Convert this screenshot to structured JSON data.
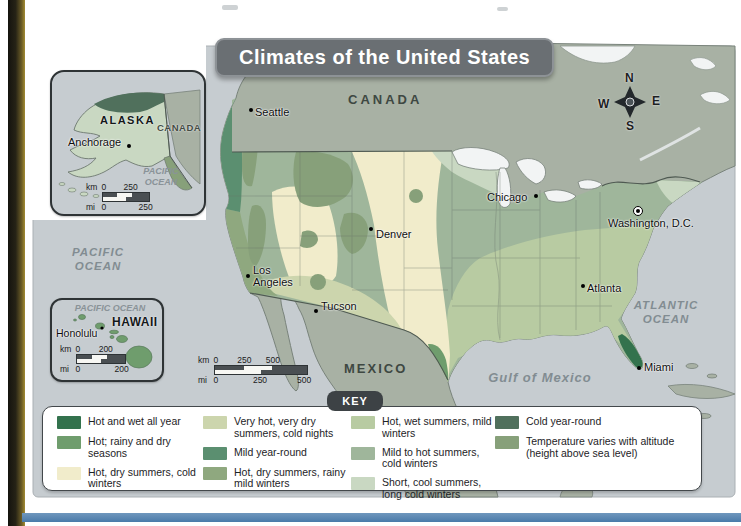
{
  "title": "Climates of the United States",
  "colors": {
    "ocean": "#c6ccd0",
    "foreign_land": "#a8b1a4",
    "lake": "#f2f4f4",
    "title_bg": "#6a6f73",
    "key_tab_bg": "#3d4245"
  },
  "map": {
    "countries": [
      {
        "name": "CANADA"
      },
      {
        "name": "MEXICO"
      }
    ],
    "oceans": [
      {
        "name": "PACIFIC OCEAN"
      },
      {
        "name": "ATLANTIC OCEAN"
      },
      {
        "name": "Gulf of Mexico"
      }
    ],
    "cities": [
      {
        "name": "Seattle"
      },
      {
        "name": "Chicago"
      },
      {
        "name": "Washington, D.C."
      },
      {
        "name": "Denver"
      },
      {
        "name": "Los Angeles"
      },
      {
        "name": "Tucson"
      },
      {
        "name": "Atlanta"
      },
      {
        "name": "Miami"
      }
    ],
    "compass": {
      "north": "N",
      "east": "E",
      "south": "S",
      "west": "W"
    },
    "scale": {
      "unit_top": "km",
      "unit_bottom": "mi",
      "top_ticks": [
        "0",
        "250",
        "500"
      ],
      "bottom_ticks": [
        "0",
        "250",
        "500"
      ]
    }
  },
  "insets": {
    "alaska": {
      "region": "ALASKA",
      "neighbor": "CANADA",
      "city": "Anchorage",
      "ocean": "PACIFIC OCEAN",
      "scale": {
        "unit_top": "km",
        "unit_bottom": "mi",
        "top_ticks": [
          "0",
          "250"
        ],
        "bottom_ticks": [
          "0",
          "250"
        ]
      }
    },
    "hawaii": {
      "region": "HAWAII",
      "city": "Honolulu",
      "ocean": "PACIFIC OCEAN",
      "scale": {
        "unit_top": "km",
        "unit_bottom": "mi",
        "top_ticks": [
          "0",
          "200"
        ],
        "bottom_ticks": [
          "0",
          "200"
        ]
      }
    }
  },
  "key": {
    "title": "KEY",
    "items": [
      {
        "label": "Hot and wet all year",
        "color": "#33724d"
      },
      {
        "label": "Hot; rainy and dry seasons",
        "color": "#6f9d6d"
      },
      {
        "label": "Hot, dry summers, cold winters",
        "color": "#f1eccb"
      },
      {
        "label": "Very hot, very dry summers, cold nights",
        "color": "#ccd5ad"
      },
      {
        "label": "Mild year-round",
        "color": "#5b8f70"
      },
      {
        "label": "Hot, dry summers, rainy mild winters",
        "color": "#8fa87f"
      },
      {
        "label": "Hot, wet summers, mild winters",
        "color": "#b8cba2"
      },
      {
        "label": "Mild to hot summers, cold winters",
        "color": "#9fb69b"
      },
      {
        "label": "Short, cool summers, long cold winters",
        "color": "#c9d8c2"
      },
      {
        "label": "Cold year-round",
        "color": "#50705c"
      },
      {
        "label": "Temperature varies with altitude (height above sea level)",
        "color": "#87a07a"
      }
    ]
  }
}
